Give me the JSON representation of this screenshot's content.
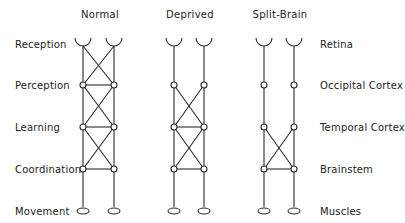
{
  "columns": [
    {
      "title": "Normal",
      "x_left": 83,
      "x_right": 114
    },
    {
      "title": "Deprived",
      "x_left": 174,
      "x_right": 204
    },
    {
      "title": "Split-Brain",
      "x_left": 264,
      "x_right": 294
    }
  ],
  "left_labels": [
    "Reception",
    "Perception",
    "Learning",
    "Coordination",
    "Movement"
  ],
  "right_labels": [
    "Retina",
    "Occipital Cortex",
    "Temporal Cortex",
    "Brainstem",
    "Muscles"
  ],
  "row_y": [
    44,
    85,
    127,
    169,
    211
  ],
  "connections": {
    "Normal": {
      "crosses": [
        "reception-perception",
        "perception-learning",
        "learning-coordination"
      ],
      "horizontals": [
        "perception",
        "learning",
        "coordination"
      ]
    },
    "Deprived": {
      "crosses": [
        "perception-learning",
        "learning-coordination"
      ],
      "horizontals": [
        "learning",
        "coordination"
      ]
    },
    "Split-Brain": {
      "crosses": [
        "learning-coordination"
      ],
      "horizontals": [
        "coordination"
      ]
    }
  }
}
